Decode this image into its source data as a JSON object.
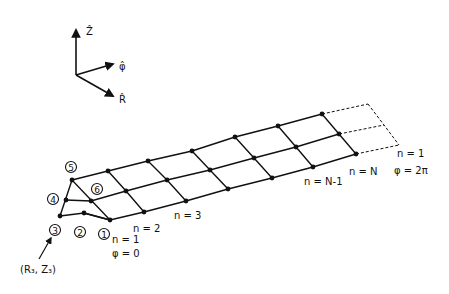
{
  "axes": {
    "z_label": "Ẑ",
    "phi_label": "φ̂",
    "r_label": "R̂"
  },
  "node_labels": [
    "1",
    "2",
    "3",
    "4",
    "5",
    "6"
  ],
  "point_label": "(R₃, Z₃)",
  "n_labels": {
    "n1_start": "n = 1",
    "phi_start": "φ = 0",
    "n2": "n = 2",
    "n3": "n = 3",
    "nN1": "n = N-1",
    "nN": "n = N",
    "n1_end": "n = 1",
    "phi_end": "φ = 2π"
  }
}
